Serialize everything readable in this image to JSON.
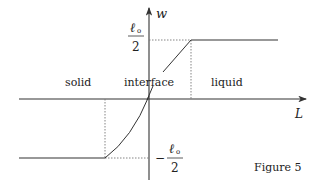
{
  "figure": {
    "caption": "Figure 5",
    "axes": {
      "x_label": "L",
      "y_label": "w"
    },
    "ticks": {
      "upper": {
        "numerator": "ℓ",
        "subscript": "o",
        "denominator": "2",
        "sign": ""
      },
      "lower": {
        "numerator": "ℓ",
        "subscript": "o",
        "denominator": "2",
        "sign": "−"
      }
    },
    "regions": [
      {
        "label": "solid"
      },
      {
        "label": "interface"
      },
      {
        "label": "liquid"
      }
    ],
    "colors": {
      "stroke": "#333333",
      "dotted": "#777777",
      "background": "#ffffff"
    }
  }
}
